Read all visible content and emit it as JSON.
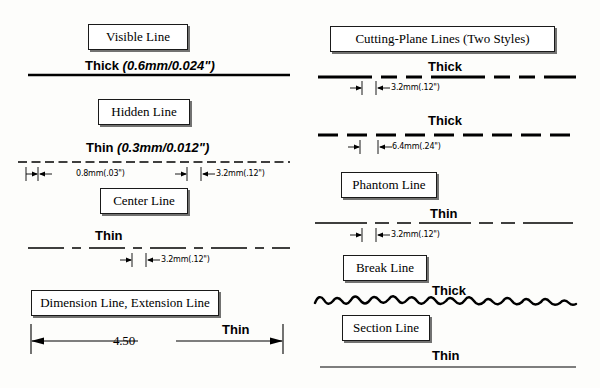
{
  "document": {
    "title": "Technical Drawing Line Types Reference",
    "background_color": "#fdfdfb",
    "ink_color": "#000000"
  },
  "labels": {
    "visible_line": "Visible Line",
    "hidden_line": "Hidden Line",
    "center_line": "Center Line",
    "dimension_extension_line": "Dimension Line, Extension Line",
    "cutting_plane_lines": "Cutting-Plane Lines (Two Styles)",
    "phantom_line": "Phantom Line",
    "break_line": "Break Line",
    "section_line": "Section Line"
  },
  "weights": {
    "visible": "Thick",
    "visible_spec": "(0.6mm/0.024\")",
    "hidden": "Thin",
    "hidden_spec": "(0.3mm/0.012\")",
    "center": "Thin",
    "dimension": "Thin",
    "cutting_plane_1": "Thick",
    "cutting_plane_2": "Thick",
    "phantom": "Thin",
    "break": "Thick",
    "section": "Thin"
  },
  "callouts": {
    "hidden_dash": "0.8mm(.03\")",
    "hidden_gap": "3.2mm(.12\")",
    "center_gap": "3.2mm(.12\")",
    "cutting_plane_1_gap": "3.2mm(.12\")",
    "cutting_plane_2_gap": "6.4mm(.24\")",
    "phantom_gap": "3.2mm(.12\")"
  },
  "dimension_value": "4.50",
  "line_specs": [
    {
      "name": "visible-line",
      "weight_label": "Thick",
      "stroke_width": 2.6,
      "pattern": "solid",
      "dasharray": ""
    },
    {
      "name": "hidden-line",
      "weight_label": "Thin",
      "stroke_width": 1.3,
      "pattern": "short-dash",
      "dasharray": "9 4"
    },
    {
      "name": "center-line",
      "weight_label": "Thin",
      "stroke_width": 1.3,
      "pattern": "long-short-long",
      "dasharray": "36 7 9 7"
    },
    {
      "name": "dimension-line",
      "weight_label": "Thin",
      "stroke_width": 1.3,
      "pattern": "solid-with-arrows",
      "dasharray": ""
    },
    {
      "name": "cutting-plane-line-style-1",
      "weight_label": "Thick",
      "stroke_width": 2.8,
      "pattern": "long-short-short-long",
      "dasharray": "54 9 16 9 16 9"
    },
    {
      "name": "cutting-plane-line-style-2",
      "weight_label": "Thick",
      "stroke_width": 2.8,
      "pattern": "even-dash",
      "dasharray": "20 9"
    },
    {
      "name": "phantom-line",
      "weight_label": "Thin",
      "stroke_width": 1.3,
      "pattern": "long-short-short-long",
      "dasharray": "52 8 14 8 14 8"
    },
    {
      "name": "break-line",
      "weight_label": "Thick",
      "stroke_width": 2.4,
      "pattern": "freehand-wave",
      "dasharray": ""
    },
    {
      "name": "section-line",
      "weight_label": "Thin",
      "stroke_width": 1.2,
      "pattern": "solid",
      "dasharray": ""
    }
  ]
}
